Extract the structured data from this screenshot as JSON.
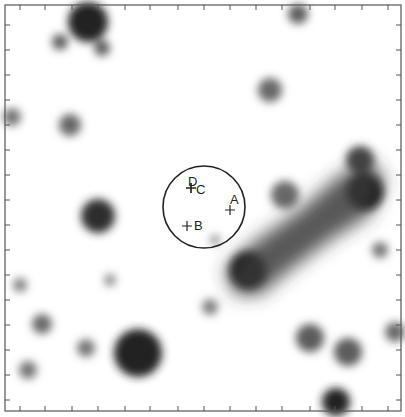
{
  "image": {
    "description": "Grayscale astronomical field with a circular aperture and labeled sources",
    "frame_color": "#555555",
    "circle": {
      "cx": 204,
      "cy": 207,
      "r": 41
    },
    "markers": [
      {
        "label": "A",
        "x": 230,
        "y": 210,
        "lx": 230,
        "ly": 204
      },
      {
        "label": "B",
        "x": 187,
        "y": 226,
        "lx": 194,
        "ly": 230
      },
      {
        "label": "C",
        "x": 191,
        "y": 188,
        "lx": 196,
        "ly": 194
      },
      {
        "label": "D",
        "x": 191,
        "y": 188,
        "lx": 188,
        "ly": 186
      }
    ],
    "sources": [
      {
        "x": 88,
        "y": 22,
        "r": 20,
        "d": 0.85
      },
      {
        "x": 60,
        "y": 42,
        "r": 8,
        "d": 0.6
      },
      {
        "x": 102,
        "y": 48,
        "r": 8,
        "d": 0.6
      },
      {
        "x": 298,
        "y": 14,
        "r": 10,
        "d": 0.6
      },
      {
        "x": 270,
        "y": 90,
        "r": 12,
        "d": 0.55
      },
      {
        "x": 70,
        "y": 125,
        "r": 11,
        "d": 0.55
      },
      {
        "x": 12,
        "y": 117,
        "r": 9,
        "d": 0.5
      },
      {
        "x": 98,
        "y": 216,
        "r": 17,
        "d": 0.8
      },
      {
        "x": 138,
        "y": 353,
        "r": 24,
        "d": 0.85
      },
      {
        "x": 42,
        "y": 324,
        "r": 10,
        "d": 0.55
      },
      {
        "x": 86,
        "y": 348,
        "r": 9,
        "d": 0.5
      },
      {
        "x": 28,
        "y": 370,
        "r": 9,
        "d": 0.5
      },
      {
        "x": 210,
        "y": 307,
        "r": 8,
        "d": 0.45
      },
      {
        "x": 310,
        "y": 338,
        "r": 14,
        "d": 0.6
      },
      {
        "x": 348,
        "y": 352,
        "r": 14,
        "d": 0.6
      },
      {
        "x": 395,
        "y": 332,
        "r": 10,
        "d": 0.55
      },
      {
        "x": 336,
        "y": 402,
        "r": 14,
        "d": 0.85
      },
      {
        "x": 248,
        "y": 270,
        "r": 18,
        "d": 0.95
      },
      {
        "x": 365,
        "y": 192,
        "r": 18,
        "d": 0.95
      },
      {
        "x": 360,
        "y": 160,
        "r": 14,
        "d": 0.7
      },
      {
        "x": 285,
        "y": 195,
        "r": 14,
        "d": 0.55
      },
      {
        "x": 380,
        "y": 250,
        "r": 8,
        "d": 0.5
      },
      {
        "x": 20,
        "y": 285,
        "r": 7,
        "d": 0.45
      },
      {
        "x": 110,
        "y": 280,
        "r": 6,
        "d": 0.4
      },
      {
        "x": 215,
        "y": 240,
        "r": 5,
        "d": 0.4
      }
    ],
    "ticks": {
      "left": [
        25,
        50,
        75,
        100,
        125,
        150,
        175,
        200,
        225,
        250,
        275,
        300,
        325,
        350,
        375,
        400
      ],
      "bottom": [
        20,
        45,
        72,
        98,
        125,
        150,
        178,
        204,
        230,
        256,
        282,
        310,
        335,
        362,
        388
      ]
    }
  }
}
